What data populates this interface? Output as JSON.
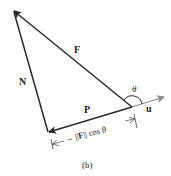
{
  "diagram": {
    "labels": {
      "F": "F",
      "N": "N",
      "P": "P",
      "u": "u",
      "theta": "θ",
      "projection_prefix": "||",
      "projection_F": "F",
      "projection_suffix": "|| cos ",
      "projection_theta": "θ",
      "caption": "(b)"
    },
    "colors": {
      "vector": "#2a2a2a",
      "unit_vector": "#8a8a8a",
      "dimension": "#555555"
    }
  }
}
